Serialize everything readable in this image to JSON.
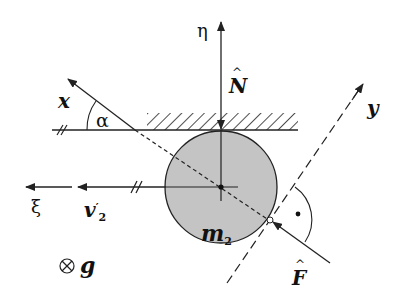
{
  "diagram": {
    "type": "free-body diagram",
    "colors": {
      "line": "#222222",
      "disk_fill": "#c4c4c4",
      "background": "#ffffff"
    },
    "body": {
      "label_symbol": "m",
      "label_subscript": "2"
    },
    "axes": {
      "x": "x",
      "y": "y",
      "eta": "η",
      "xi": "ξ"
    },
    "angle_label": "α",
    "forces": {
      "normal_symbol": "N",
      "contact_symbol": "F"
    },
    "velocity": {
      "symbol": "v",
      "subscript": "2",
      "prime": "′"
    },
    "gravity": {
      "marker": "⊗",
      "symbol": "g"
    },
    "right_angle_marker": "•"
  }
}
